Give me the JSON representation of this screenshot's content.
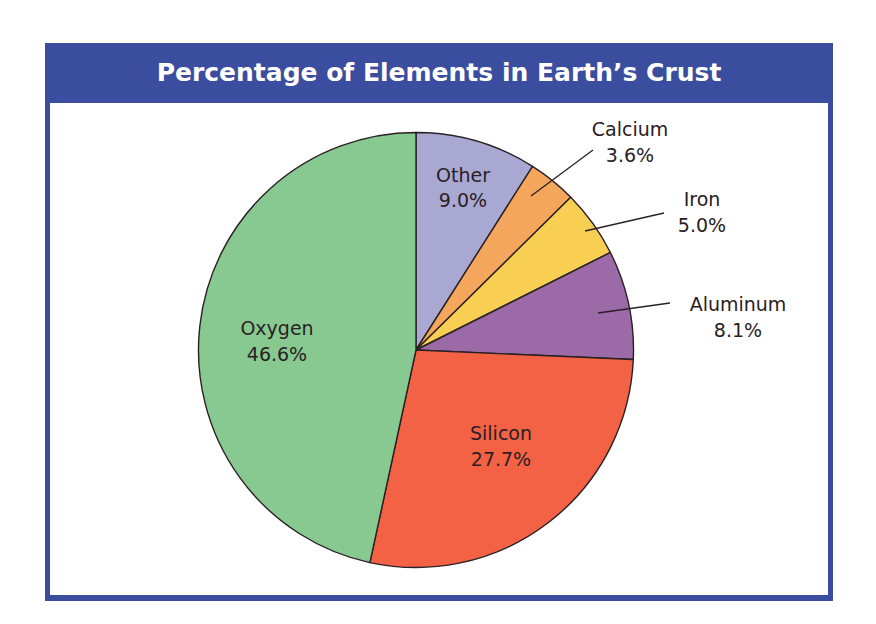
{
  "chart_data": {
    "type": "pie",
    "title": "Percentage of Elements in Earth’s Crust",
    "start_angle_deg": 0,
    "direction": "clockwise-from-top",
    "slices": [
      {
        "name": "Other",
        "label": "Other",
        "value": 9.0,
        "value_label": "9.0%",
        "color": "#a9a8d3",
        "label_position": "inside"
      },
      {
        "name": "Calcium",
        "label": "Calcium",
        "value": 3.6,
        "value_label": "3.6%",
        "color": "#f4a65c",
        "label_position": "outside"
      },
      {
        "name": "Iron",
        "label": "Iron",
        "value": 5.0,
        "value_label": "5.0%",
        "color": "#f8cf52",
        "label_position": "outside"
      },
      {
        "name": "Aluminum",
        "label": "Aluminum",
        "value": 8.1,
        "value_label": "8.1%",
        "color": "#9c6ba7",
        "label_position": "outside"
      },
      {
        "name": "Silicon",
        "label": "Silicon",
        "value": 27.7,
        "value_label": "27.7%",
        "color": "#f46246",
        "label_position": "inside"
      },
      {
        "name": "Oxygen",
        "label": "Oxygen",
        "value": 46.6,
        "value_label": "46.6%",
        "color": "#87c991",
        "label_position": "inside"
      }
    ],
    "frame_color": "#3b4d9e",
    "title_color": "#ffffff"
  }
}
